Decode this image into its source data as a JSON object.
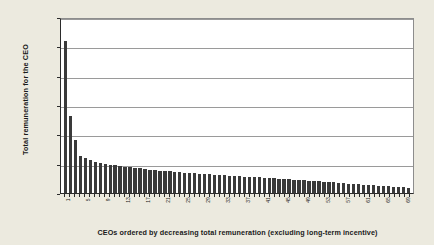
{
  "chart_data": {
    "type": "bar",
    "title": "",
    "subtitle": "",
    "xlabel": "CEOs ordered by decreasing total remuneration (excluding long-term incentive)",
    "ylabel": "Total remuneration for the CEO",
    "ylim": [
      0,
      30000000
    ],
    "ytick_labels": [
      "$30,000,000",
      "$25,000,000",
      "$20,000,000",
      "$15,000,000",
      "$10,000,000",
      "$5,000,000",
      "$0"
    ],
    "ytick_values": [
      30000000,
      25000000,
      20000000,
      15000000,
      10000000,
      5000000,
      0
    ],
    "grid": "horizontal",
    "legend": "none",
    "bar_color": "#3a3a3a",
    "plot_background": "#ffffff",
    "figure_background": "#eceadf",
    "categories": [
      "1",
      "2",
      "3",
      "4",
      "5",
      "6",
      "7",
      "8",
      "9",
      "10",
      "11",
      "12",
      "13",
      "14",
      "15",
      "16",
      "17",
      "18",
      "19",
      "20",
      "21",
      "22",
      "23",
      "24",
      "25",
      "26",
      "27",
      "28",
      "29",
      "30",
      "31",
      "32",
      "33",
      "34",
      "35",
      "36",
      "37",
      "38",
      "39",
      "40",
      "41",
      "42",
      "43",
      "44",
      "45",
      "46",
      "47",
      "48",
      "49",
      "50",
      "51",
      "52",
      "53",
      "54",
      "55",
      "56",
      "57",
      "58",
      "59",
      "60",
      "61",
      "62",
      "63",
      "64",
      "65",
      "66",
      "67",
      "68",
      "69",
      "70"
    ],
    "xtick_labels_shown": [
      "1",
      "5",
      "9",
      "13",
      "17",
      "21",
      "25",
      "29",
      "33",
      "37",
      "41",
      "45",
      "49",
      "53",
      "57",
      "61",
      "65",
      "69"
    ],
    "values": [
      25900000,
      13100000,
      9000000,
      6300000,
      5900000,
      5600000,
      5350000,
      5150000,
      5000000,
      4850000,
      4700000,
      4600000,
      4500000,
      4400000,
      4300000,
      4200000,
      4100000,
      4000000,
      3900000,
      3820000,
      3750000,
      3680000,
      3600000,
      3540000,
      3480000,
      3420000,
      3360000,
      3300000,
      3240000,
      3180000,
      3120000,
      3060000,
      3000000,
      2950000,
      2900000,
      2850000,
      2800000,
      2750000,
      2700000,
      2650000,
      2600000,
      2550000,
      2500000,
      2450000,
      2400000,
      2340000,
      2280000,
      2220000,
      2160000,
      2100000,
      2040000,
      1980000,
      1920000,
      1860000,
      1800000,
      1740000,
      1680000,
      1620000,
      1560000,
      1500000,
      1440000,
      1380000,
      1320000,
      1260000,
      1200000,
      1140000,
      1080000,
      1020000,
      960000,
      900000
    ]
  }
}
